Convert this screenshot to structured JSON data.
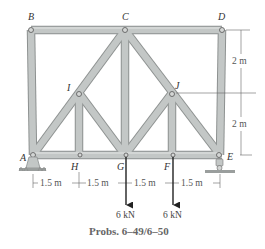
{
  "figure": {
    "caption": "Probs. 6–49/6–50",
    "joints": {
      "A": "A",
      "B": "B",
      "C": "C",
      "D": "D",
      "E": "E",
      "F": "F",
      "G": "G",
      "H": "H",
      "I": "I",
      "J": "J"
    },
    "dimensions": {
      "horizontal": [
        "1.5 m",
        "1.5 m",
        "1.5 m",
        "1.5 m"
      ],
      "vertical": [
        "2 m",
        "2 m"
      ]
    },
    "loads": [
      {
        "joint": "G",
        "label": "6 kN"
      },
      {
        "joint": "F",
        "label": "6 kN"
      }
    ],
    "supports": [
      {
        "joint": "A",
        "type": "pin"
      },
      {
        "joint": "E",
        "type": "roller"
      }
    ],
    "colors": {
      "member_fill": "#bfc3c2",
      "member_edge": "#8d9190",
      "line": "#444444",
      "arrow": "#222222"
    }
  }
}
